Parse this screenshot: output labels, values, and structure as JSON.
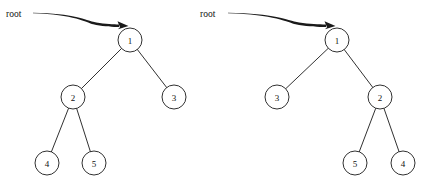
{
  "figure": {
    "type": "binary-tree-diagram-pair",
    "width": 427,
    "height": 188,
    "background_color": "#ffffff",
    "stroke_color": "#1a1a1a",
    "text_color": "#111111"
  },
  "trees": [
    {
      "id": "left-tree",
      "root_label": "root",
      "root_label_position": {
        "x": 6,
        "y": 14
      },
      "arrow": {
        "name": "root-pointer-arrow",
        "start": {
          "x": 33,
          "y": 13
        },
        "end": {
          "x": 130,
          "y": 27
        }
      },
      "nodes": [
        {
          "id": "L1",
          "label": "1",
          "x": 130,
          "y": 40,
          "r": 12
        },
        {
          "id": "L2",
          "label": "2",
          "x": 73,
          "y": 97,
          "r": 12
        },
        {
          "id": "L3",
          "label": "3",
          "x": 174,
          "y": 97,
          "r": 12
        },
        {
          "id": "L4",
          "label": "4",
          "x": 47,
          "y": 163,
          "r": 12
        },
        {
          "id": "L5",
          "label": "5",
          "x": 94,
          "y": 163,
          "r": 12
        }
      ],
      "edges": [
        {
          "from": "L1",
          "to": "L2"
        },
        {
          "from": "L1",
          "to": "L3"
        },
        {
          "from": "L2",
          "to": "L4"
        },
        {
          "from": "L2",
          "to": "L5"
        }
      ]
    },
    {
      "id": "right-tree",
      "root_label": "root",
      "root_label_position": {
        "x": 200,
        "y": 14
      },
      "arrow": {
        "name": "root-pointer-arrow",
        "start": {
          "x": 228,
          "y": 13
        },
        "end": {
          "x": 337,
          "y": 27
        }
      },
      "nodes": [
        {
          "id": "R1",
          "label": "1",
          "x": 337,
          "y": 40,
          "r": 12
        },
        {
          "id": "R3",
          "label": "3",
          "x": 277,
          "y": 97,
          "r": 12
        },
        {
          "id": "R2",
          "label": "2",
          "x": 380,
          "y": 97,
          "r": 12
        },
        {
          "id": "R5",
          "label": "5",
          "x": 355,
          "y": 163,
          "r": 12
        },
        {
          "id": "R4",
          "label": "4",
          "x": 403,
          "y": 163,
          "r": 12
        }
      ],
      "edges": [
        {
          "from": "R1",
          "to": "R3"
        },
        {
          "from": "R1",
          "to": "R2"
        },
        {
          "from": "R2",
          "to": "R5"
        },
        {
          "from": "R2",
          "to": "R4"
        }
      ]
    }
  ]
}
